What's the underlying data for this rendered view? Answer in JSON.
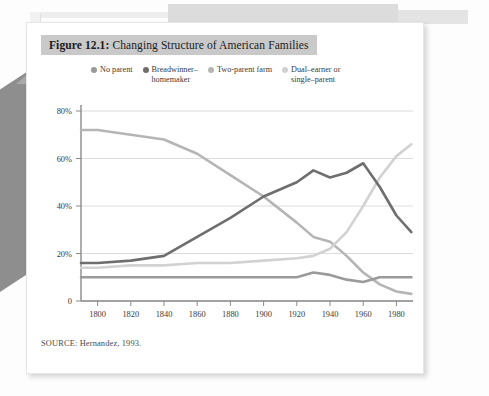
{
  "figure": {
    "number_label": "Figure 12.1:",
    "title": " Changing Structure of American Families",
    "source": "SOURCE: Hernandez, 1993."
  },
  "colors": {
    "no_parent": "#9a9a9a",
    "breadwinner_homemaker": "#6e6e6e",
    "two_parent_farm": "#b5b5b5",
    "dual_earner_single_parent": "#d2d2d2",
    "grid": "#dcdcdc",
    "axis": "#8a8a8a",
    "title_band": "#c9c9c9",
    "text": "#3a3a3a"
  },
  "chart_data": {
    "type": "line",
    "title": "Changing Structure of American Families",
    "xlabel": "",
    "ylabel": "",
    "xlim": [
      1790,
      1990
    ],
    "ylim": [
      0,
      80
    ],
    "grid": true,
    "legend_position": "top",
    "xticks": [
      1800,
      1820,
      1840,
      1860,
      1880,
      1900,
      1920,
      1940,
      1960,
      1980
    ],
    "xtick_labels": [
      "1800",
      "1820",
      "1840",
      "1860",
      "1880",
      "1900",
      "1920",
      "1940",
      "1960",
      "1980"
    ],
    "yticks": [
      0,
      20,
      40,
      60,
      80
    ],
    "ytick_labels": [
      "0",
      "20%",
      "40%",
      "60%",
      "80%"
    ],
    "x": [
      1790,
      1800,
      1820,
      1840,
      1860,
      1880,
      1900,
      1920,
      1930,
      1940,
      1950,
      1960,
      1970,
      1980,
      1989
    ],
    "series": [
      {
        "name": "Two-parent farm",
        "color": "#b5b5b5",
        "values": [
          72,
          72,
          70,
          68,
          62,
          53,
          44,
          33,
          27,
          25,
          19,
          12,
          7,
          4,
          3
        ]
      },
      {
        "name": "Breadwinner-homemaker",
        "color": "#6e6e6e",
        "values": [
          16,
          16,
          17,
          19,
          27,
          35,
          44,
          50,
          55,
          52,
          54,
          58,
          48,
          36,
          29
        ]
      },
      {
        "name": "Dual-earner or single-parent",
        "color": "#d2d2d2",
        "values": [
          14,
          14,
          15,
          15,
          16,
          16,
          17,
          18,
          19,
          22,
          29,
          40,
          52,
          61,
          66
        ]
      },
      {
        "name": "No parent",
        "color": "#9a9a9a",
        "values": [
          10,
          10,
          10,
          10,
          10,
          10,
          10,
          10,
          12,
          11,
          9,
          8,
          10,
          10,
          10
        ]
      }
    ]
  },
  "legend": {
    "items": [
      {
        "label": "No parent",
        "color": "#9a9a9a"
      },
      {
        "label": "Breadwinner–\nhomemaker",
        "color": "#6e6e6e"
      },
      {
        "label": "Two-parent farm",
        "color": "#b5b5b5"
      },
      {
        "label": "Dual–earner or\nsingle–parent",
        "color": "#d2d2d2"
      }
    ]
  }
}
